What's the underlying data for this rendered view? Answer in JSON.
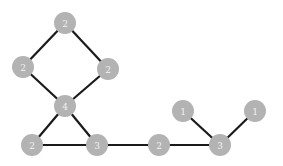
{
  "graph": {
    "title": "",
    "node_fill": "#b3b3b3",
    "edge_color": "#1a1a1a",
    "label_color": "#f2f2f2",
    "nodes": [
      {
        "id": "top",
        "label": "2",
        "x": 65,
        "y": 23
      },
      {
        "id": "left",
        "label": "2",
        "x": 23,
        "y": 67
      },
      {
        "id": "right",
        "label": "2",
        "x": 108,
        "y": 69
      },
      {
        "id": "center",
        "label": "4",
        "x": 65,
        "y": 106
      },
      {
        "id": "bottom-left",
        "label": "2",
        "x": 32,
        "y": 145
      },
      {
        "id": "bottom-mid",
        "label": "3",
        "x": 97,
        "y": 145
      },
      {
        "id": "mid",
        "label": "2",
        "x": 159,
        "y": 145
      },
      {
        "id": "bottom-right",
        "label": "3",
        "x": 220,
        "y": 145
      },
      {
        "id": "leaf-a",
        "label": "1",
        "x": 183,
        "y": 111
      },
      {
        "id": "leaf-b",
        "label": "1",
        "x": 255,
        "y": 111
      }
    ],
    "edges": [
      [
        "top",
        "left"
      ],
      [
        "top",
        "right"
      ],
      [
        "left",
        "center"
      ],
      [
        "right",
        "center"
      ],
      [
        "center",
        "bottom-left"
      ],
      [
        "center",
        "bottom-mid"
      ],
      [
        "bottom-left",
        "bottom-mid"
      ],
      [
        "bottom-mid",
        "mid"
      ],
      [
        "mid",
        "bottom-right"
      ],
      [
        "bottom-right",
        "leaf-a"
      ],
      [
        "bottom-right",
        "leaf-b"
      ]
    ]
  }
}
